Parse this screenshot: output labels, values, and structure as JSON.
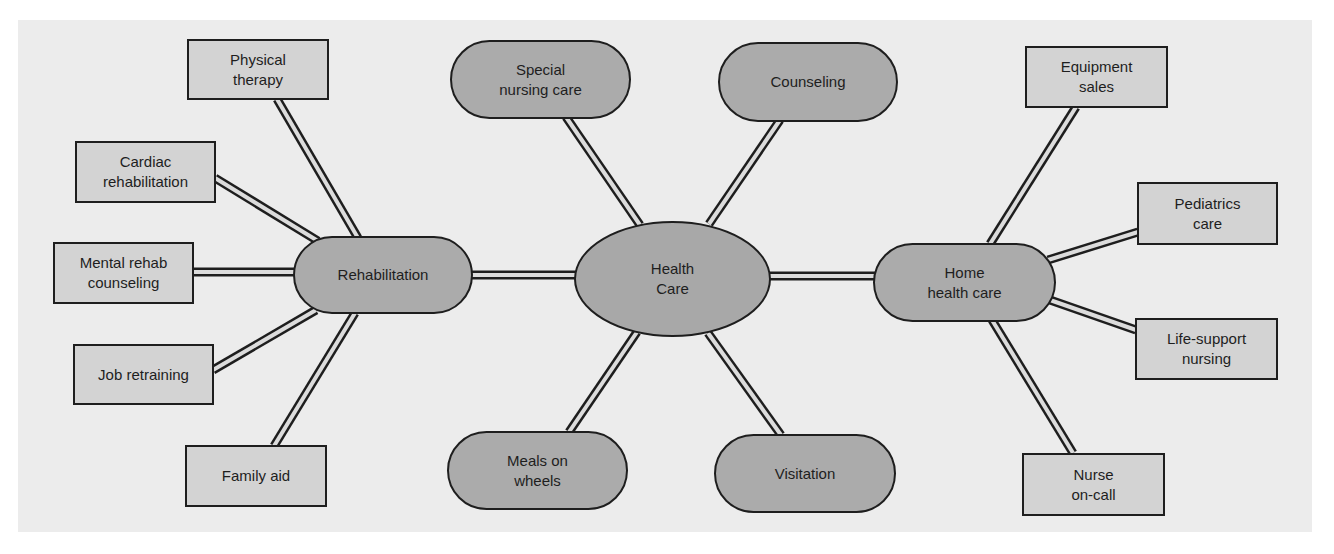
{
  "diagram": {
    "type": "concept-map",
    "colors": {
      "background": "#ececec",
      "box_fill": "#d3d3d3",
      "pill_fill": "#ababab",
      "center_fill": "#a8a8a8",
      "stroke": "#1e1e1e",
      "connector_fill": "#dcdcdc"
    },
    "center": {
      "id": "health-care",
      "label": "Health\nCare"
    },
    "hubs": {
      "rehabilitation": {
        "label": "Rehabilitation"
      },
      "home_health_care": {
        "label": "Home\nhealth care"
      },
      "special_nursing_care": {
        "label": "Special\nnursing care"
      },
      "counseling": {
        "label": "Counseling"
      },
      "meals_on_wheels": {
        "label": "Meals on\nwheels"
      },
      "visitation": {
        "label": "Visitation"
      }
    },
    "rehabilitation_children": {
      "physical_therapy": {
        "label": "Physical\ntherapy"
      },
      "cardiac_rehabilitation": {
        "label": "Cardiac\nrehabilitation"
      },
      "mental_rehab_counseling": {
        "label": "Mental rehab\ncounseling"
      },
      "job_retraining": {
        "label": "Job retraining"
      },
      "family_aid": {
        "label": "Family aid"
      }
    },
    "home_health_care_children": {
      "equipment_sales": {
        "label": "Equipment\nsales"
      },
      "pediatrics_care": {
        "label": "Pediatrics\ncare"
      },
      "life_support_nursing": {
        "label": "Life-support\nnursing"
      },
      "nurse_on_call": {
        "label": "Nurse\non-call"
      }
    },
    "edges": [
      [
        "Health Care",
        "Rehabilitation"
      ],
      [
        "Health Care",
        "Home health care"
      ],
      [
        "Health Care",
        "Special nursing care"
      ],
      [
        "Health Care",
        "Counseling"
      ],
      [
        "Health Care",
        "Meals on wheels"
      ],
      [
        "Health Care",
        "Visitation"
      ],
      [
        "Rehabilitation",
        "Physical therapy"
      ],
      [
        "Rehabilitation",
        "Cardiac rehabilitation"
      ],
      [
        "Rehabilitation",
        "Mental rehab counseling"
      ],
      [
        "Rehabilitation",
        "Job retraining"
      ],
      [
        "Rehabilitation",
        "Family aid"
      ],
      [
        "Home health care",
        "Equipment sales"
      ],
      [
        "Home health care",
        "Pediatrics care"
      ],
      [
        "Home health care",
        "Life-support nursing"
      ],
      [
        "Home health care",
        "Nurse on-call"
      ]
    ]
  }
}
